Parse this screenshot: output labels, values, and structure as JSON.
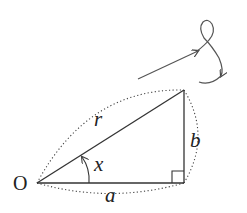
{
  "diagram": {
    "type": "right-triangle",
    "origin_label": "O",
    "hypotenuse_label": "r",
    "adjacent_label": "a",
    "opposite_label": "b",
    "angle_label": "x",
    "colors": {
      "stroke": "#333333",
      "background": "#ffffff"
    },
    "features": {
      "right_angle_marker": true,
      "dotted_arcs": [
        "hypotenuse",
        "adjacent",
        "opposite"
      ],
      "angle_arrow": "counterclockwise",
      "rotation_arrow": "looped arrow pointing clockwise"
    }
  }
}
